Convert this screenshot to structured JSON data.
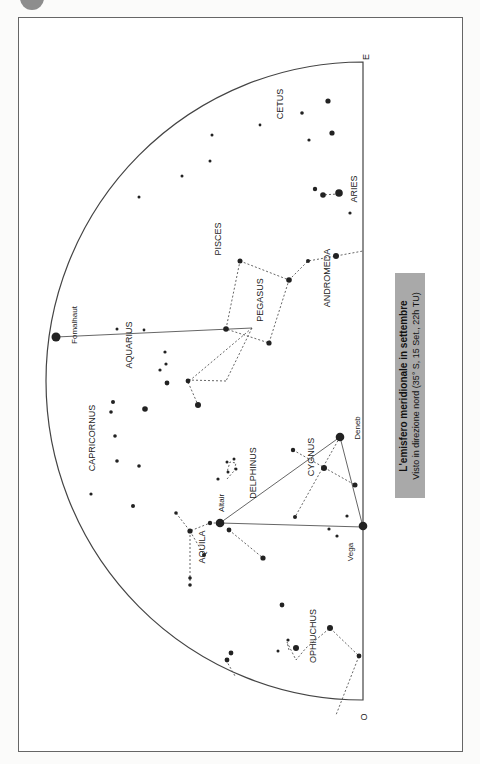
{
  "title": "L'emisfero meridionale in settembre",
  "subtitle": "Visto in direzione nord (35° S, 15 Set., 22h TU)",
  "colors": {
    "background": "#ffffff",
    "frame": "#666666",
    "star": "#222222",
    "caption_box": "#a9a9a9",
    "corner_dot": "#8d8d8d"
  },
  "horizon": {
    "top_label": "E",
    "bottom_label": "O"
  },
  "constellations": {
    "cetus": "CETUS",
    "aries": "ARIES",
    "pisces": "PISCES",
    "andromeda": "ANDROMEDA",
    "pegasus": "PEGASUS",
    "aquarius": "AQUARIUS",
    "capricornus": "CAPRICORNUS",
    "delphinus": "DELPHINUS",
    "cygnus": "CYGNUS",
    "aquila": "AQUILA",
    "ophiuchus": "OPHIUCHUS"
  },
  "stars": {
    "fomalhaut": "Fomalhaut",
    "altair": "Altair",
    "deneb": "Deneb",
    "vega": "Vega"
  }
}
